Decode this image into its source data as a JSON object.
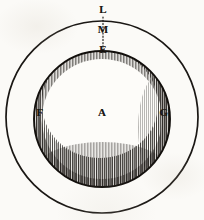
{
  "figure": {
    "kind": "geometric-diagram",
    "background_color": "#fbfaf7",
    "ink_color": "#1a1714",
    "outer_circle": {
      "name": "outer-circle",
      "center_x": 102,
      "center_y": 117,
      "radius": 96
    },
    "inner_circle": {
      "name": "inner-circle",
      "center_x": 102,
      "center_y": 119,
      "radius": 69
    },
    "radius_line": {
      "name": "dotted-radius-line",
      "style": "dotted",
      "x": 103,
      "y_top": 17,
      "y_bottom": 50
    },
    "labels": [
      {
        "id": "L",
        "text": "L",
        "x": 103,
        "y": 10,
        "position": "outer-circle-top"
      },
      {
        "id": "M",
        "text": "M",
        "x": 103,
        "y": 30,
        "position": "between-circles-top"
      },
      {
        "id": "E",
        "text": "E",
        "x": 103,
        "y": 50,
        "position": "inner-circle-top"
      },
      {
        "id": "A",
        "text": "A",
        "x": 102,
        "y": 113,
        "position": "center"
      },
      {
        "id": "F",
        "text": "F",
        "x": 40,
        "y": 113,
        "position": "inner-circle-left"
      },
      {
        "id": "G",
        "text": "G",
        "x": 164,
        "y": 113,
        "position": "inner-circle-right"
      }
    ],
    "shading": {
      "name": "crescent-hatching",
      "technique": "engraved line hatching",
      "coverage": "inner circle rim, heaviest at bottom and right"
    }
  }
}
